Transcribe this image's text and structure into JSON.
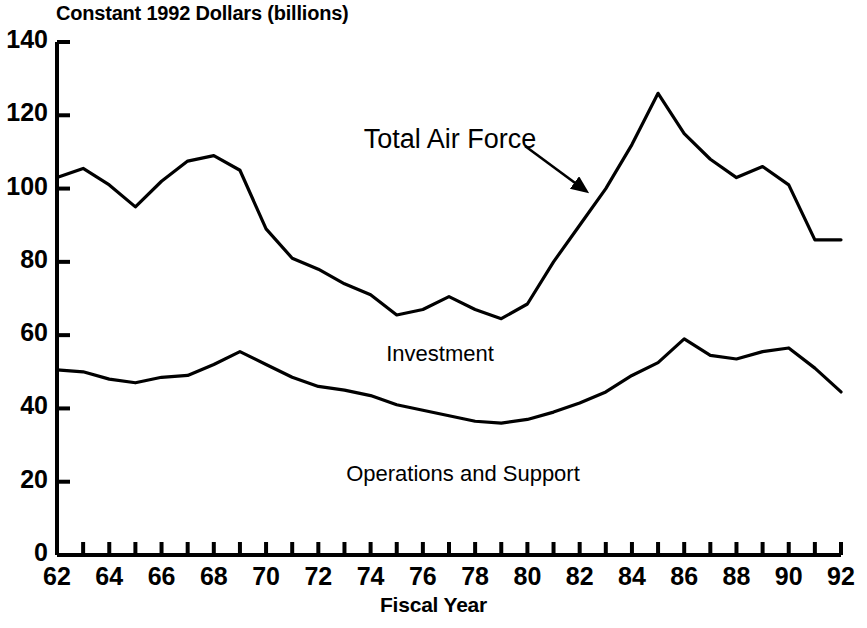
{
  "chart_data": {
    "type": "line",
    "title": "",
    "ylabel": "Constant 1992 Dollars (billions)",
    "xlabel": "Fiscal Year",
    "xlim": [
      62,
      92
    ],
    "ylim": [
      0,
      140
    ],
    "ytick_values": [
      0,
      20,
      40,
      60,
      80,
      100,
      120,
      140
    ],
    "ytick_labels": [
      "0",
      "20",
      "40",
      "60",
      "80",
      "100",
      "120",
      "140"
    ],
    "xtick_values": [
      62,
      63,
      64,
      65,
      66,
      67,
      68,
      69,
      70,
      71,
      72,
      73,
      74,
      75,
      76,
      77,
      78,
      79,
      80,
      81,
      82,
      83,
      84,
      85,
      86,
      87,
      88,
      89,
      90,
      91,
      92
    ],
    "xtick_labels_major": [
      "62",
      "64",
      "66",
      "68",
      "70",
      "72",
      "74",
      "76",
      "78",
      "80",
      "82",
      "84",
      "86",
      "88",
      "90",
      "92"
    ],
    "xtick_major_values": [
      62,
      64,
      66,
      68,
      70,
      72,
      74,
      76,
      78,
      80,
      82,
      84,
      86,
      88,
      90,
      92
    ],
    "grid": false,
    "legend_position": "inline-labels",
    "x": [
      62,
      63,
      64,
      65,
      66,
      67,
      68,
      69,
      70,
      71,
      72,
      73,
      74,
      75,
      76,
      77,
      78,
      79,
      80,
      81,
      82,
      83,
      84,
      85,
      86,
      87,
      88,
      89,
      90,
      91,
      92
    ],
    "series": [
      {
        "name": "Total Air Force",
        "label": "Total Air Force",
        "color": "#000000",
        "values": [
          103,
          105.5,
          101,
          95,
          102,
          107.5,
          109,
          105,
          89,
          81,
          78,
          74,
          71,
          65.5,
          67,
          70.5,
          67,
          64.5,
          68.5,
          80,
          90,
          100,
          112,
          126,
          115,
          108,
          103,
          106,
          101,
          86,
          86
        ]
      },
      {
        "name": "Operations and Support",
        "label": "Operations and Support",
        "color": "#000000",
        "values": [
          50.5,
          50,
          48,
          47,
          48.5,
          49,
          52,
          55.5,
          52,
          48.5,
          46,
          45,
          43.5,
          41,
          39.5,
          38,
          36.5,
          36,
          37,
          39,
          41.5,
          44.5,
          49,
          52.5,
          59,
          54.5,
          53.5,
          55.5,
          56.5,
          51,
          44.5
        ]
      }
    ],
    "annotations": [
      {
        "text": "Total Air Force",
        "x_px": 450,
        "y_px": 124,
        "arrow_from": [
          525,
          146
        ],
        "arrow_to": [
          586,
          191
        ]
      },
      {
        "text": "Investment",
        "x_px": 440,
        "y_px": 341
      },
      {
        "text": "Operations and Support",
        "x_px": 463,
        "y_px": 461
      }
    ]
  },
  "axes": {
    "y_axis_title": "Constant 1992 Dollars (billions)",
    "x_axis_title": "Fiscal Year"
  }
}
